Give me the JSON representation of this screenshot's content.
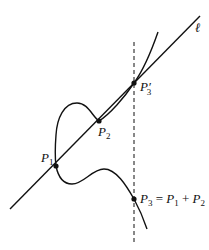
{
  "diagram": {
    "type": "elliptic-curve-point-addition",
    "colors": {
      "stroke": "#111111",
      "background": "#ffffff"
    },
    "line_label": "ℓ",
    "points": {
      "P1": {
        "base": "P",
        "sub": "1"
      },
      "P2": {
        "base": "P",
        "sub": "2"
      },
      "P3prime": {
        "base": "P",
        "prime": "′",
        "sub": "3"
      },
      "P3": {
        "base": "P",
        "sub": "3"
      }
    },
    "equation": {
      "lhs_base": "P",
      "lhs_sub": "3",
      "eq": " = ",
      "a_base": "P",
      "a_sub": "1",
      "plus": " + ",
      "b_base": "P",
      "b_sub": "2"
    }
  }
}
